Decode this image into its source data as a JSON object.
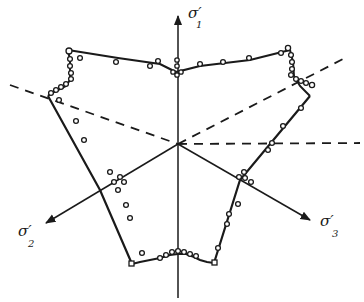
{
  "figure": {
    "type": "yield-locus-deviatoric-plane",
    "axes": [
      {
        "id": "sigma1",
        "symbol": "σ",
        "prime": "′",
        "subscript": "1",
        "direction": "up"
      },
      {
        "id": "sigma2",
        "symbol": "σ",
        "prime": "′",
        "subscript": "2",
        "direction": "lower-left"
      },
      {
        "id": "sigma3",
        "symbol": "σ",
        "prime": "′",
        "subscript": "3",
        "direction": "lower-right"
      }
    ],
    "origin": [
      178,
      144
    ],
    "solid_outline": [
      [
        68,
        50
      ],
      [
        118,
        60
      ],
      [
        178,
        74
      ],
      [
        292,
        50
      ],
      [
        296,
        82
      ],
      [
        308,
        96
      ],
      [
        235,
        175
      ],
      [
        216,
        263
      ],
      [
        205,
        262
      ],
      [
        196,
        256
      ],
      [
        188,
        252
      ],
      [
        180,
        250
      ],
      [
        170,
        253
      ],
      [
        160,
        258
      ],
      [
        145,
        264
      ],
      [
        132,
        264
      ],
      [
        96,
        183
      ],
      [
        48,
        94
      ],
      [
        58,
        88
      ],
      [
        68,
        82
      ],
      [
        70,
        70
      ],
      [
        68,
        50
      ]
    ],
    "dashed_lines": [
      {
        "from": [
          10,
          85
        ],
        "to": [
          178,
          144
        ]
      },
      {
        "from": [
          178,
          144
        ],
        "to": [
          345,
          58
        ]
      },
      {
        "from": [
          178,
          144
        ],
        "to": [
          360,
          143
        ]
      }
    ],
    "data_points": [
      [
        68,
        50
      ],
      [
        70,
        58
      ],
      [
        68,
        66
      ],
      [
        70,
        74
      ],
      [
        70,
        82
      ],
      [
        66,
        88
      ],
      [
        60,
        92
      ],
      [
        54,
        94
      ],
      [
        48,
        96
      ],
      [
        80,
        55
      ],
      [
        105,
        57
      ],
      [
        130,
        60
      ],
      [
        152,
        63
      ],
      [
        160,
        62
      ],
      [
        176,
        63
      ],
      [
        176,
        70
      ],
      [
        172,
        70
      ],
      [
        180,
        70
      ],
      [
        176,
        74
      ],
      [
        180,
        74
      ],
      [
        200,
        64
      ],
      [
        225,
        63
      ],
      [
        250,
        60
      ],
      [
        280,
        55
      ],
      [
        290,
        50
      ],
      [
        292,
        56
      ],
      [
        293,
        64
      ],
      [
        294,
        72
      ],
      [
        294,
        78
      ],
      [
        298,
        84
      ],
      [
        302,
        88
      ],
      [
        306,
        92
      ],
      [
        310,
        96
      ],
      [
        58,
        104
      ],
      [
        72,
        132
      ],
      [
        82,
        155
      ],
      [
        112,
        176
      ],
      [
        118,
        180
      ],
      [
        120,
        183
      ],
      [
        116,
        183
      ],
      [
        124,
        196
      ],
      [
        130,
        200
      ],
      [
        120,
        220
      ],
      [
        234,
        174
      ],
      [
        240,
        178
      ],
      [
        236,
        180
      ],
      [
        244,
        183
      ],
      [
        236,
        200
      ],
      [
        235,
        210
      ],
      [
        238,
        175
      ],
      [
        290,
        105
      ],
      [
        284,
        125
      ],
      [
        272,
        140
      ],
      [
        270,
        148
      ],
      [
        268,
        150
      ],
      [
        262,
        160
      ],
      [
        248,
        160
      ],
      [
        250,
        165
      ],
      [
        244,
        168
      ],
      [
        140,
        250
      ],
      [
        130,
        250
      ],
      [
        128,
        254
      ],
      [
        135,
        258
      ],
      [
        142,
        262
      ],
      [
        150,
        262
      ],
      [
        160,
        260
      ],
      [
        170,
        256
      ],
      [
        178,
        254
      ],
      [
        186,
        254
      ],
      [
        194,
        257
      ],
      [
        200,
        260
      ],
      [
        207,
        261
      ],
      [
        214,
        262
      ],
      [
        220,
        243
      ],
      [
        226,
        218
      ],
      [
        230,
        200
      ]
    ]
  }
}
